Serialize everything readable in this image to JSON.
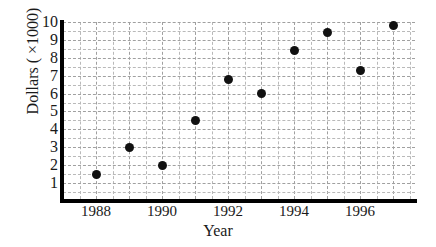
{
  "chart_data": {
    "type": "scatter",
    "title": "",
    "xlabel": "Year",
    "ylabel": "Dollars ( ×1000)",
    "xlim": [
      1987,
      1997.6
    ],
    "ylim": [
      0,
      10
    ],
    "grid": true,
    "legend": false,
    "x": [
      1988,
      1989,
      1990,
      1991,
      1992,
      1993,
      1994,
      1995,
      1996,
      1997
    ],
    "values": [
      1.5,
      3.0,
      2.0,
      4.5,
      6.8,
      6.0,
      8.4,
      9.4,
      7.3,
      9.8
    ],
    "points": [
      {
        "x": 1988,
        "y": 1.5
      },
      {
        "x": 1989,
        "y": 3.0
      },
      {
        "x": 1990,
        "y": 2.0
      },
      {
        "x": 1991,
        "y": 4.5
      },
      {
        "x": 1992,
        "y": 6.8
      },
      {
        "x": 1993,
        "y": 6.0
      },
      {
        "x": 1994,
        "y": 8.4
      },
      {
        "x": 1995,
        "y": 9.4
      },
      {
        "x": 1996,
        "y": 7.3
      },
      {
        "x": 1997,
        "y": 9.8
      }
    ],
    "xticks": [
      1988,
      1990,
      1992,
      1994,
      1996
    ],
    "xtick_labels": [
      "1988",
      "1990",
      "1992",
      "1994",
      "1996"
    ],
    "yticks": [
      1,
      2,
      3,
      4,
      5,
      6,
      7,
      8,
      9,
      10
    ],
    "ytick_labels": [
      "1",
      "2",
      "3",
      "4",
      "5",
      "6",
      "7",
      "8",
      "9",
      "10"
    ],
    "marker_color": "#111111",
    "grid_color": "#b9b9b9",
    "axis_color": "#000000",
    "background_color": "#ffffff"
  }
}
